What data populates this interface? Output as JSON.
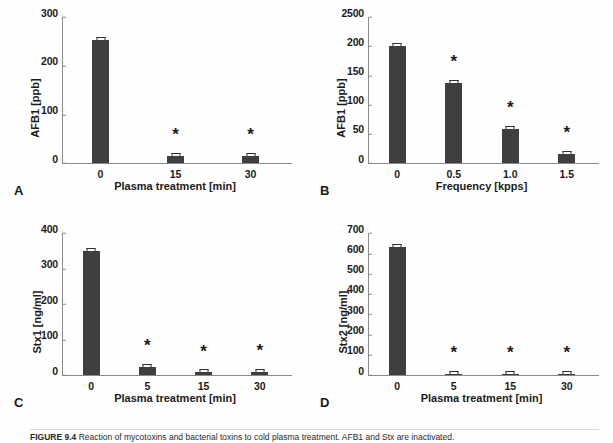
{
  "figure": {
    "caption_prefix": "FIGURE 9.4",
    "caption_text": "Reaction of mycotoxins and bacterial toxins to cold plasma treatment. AFB1 and Stx are inactivated."
  },
  "chart_data": [
    {
      "id": "A",
      "type": "bar",
      "panel_letter": "A",
      "title": "",
      "xlabel": "Plasma treatment [min]",
      "ylabel": "AFB1 [ppb]",
      "categories": [
        "0",
        "15",
        "30"
      ],
      "values": [
        255,
        15,
        14
      ],
      "errors": [
        3,
        2,
        2
      ],
      "significance": [
        "",
        "*",
        "*"
      ],
      "ylim": [
        0,
        300
      ],
      "yticks": [
        0,
        100,
        200,
        300
      ],
      "ytick_labels": [
        "0",
        "100",
        "200",
        "300"
      ],
      "grid": false,
      "legend": "none",
      "bar_color": "#3f3f3f"
    },
    {
      "id": "B",
      "type": "bar",
      "panel_letter": "B",
      "title": "",
      "xlabel": "Frequency [kpps]",
      "ylabel": "AFB1 [ppb]",
      "categories": [
        "0",
        "0.5",
        "1.0",
        "1.5"
      ],
      "values": [
        202,
        138,
        58,
        15
      ],
      "errors": [
        2,
        2,
        2,
        2
      ],
      "significance": [
        "",
        "*",
        "*",
        "*"
      ],
      "ylim": [
        0,
        250
      ],
      "yticks": [
        0,
        50,
        100,
        150,
        200,
        250
      ],
      "ytick_labels": [
        "0",
        "50",
        "100",
        "150",
        "200",
        "2500"
      ],
      "grid": false,
      "legend": "none",
      "bar_color": "#3f3f3f"
    },
    {
      "id": "C",
      "type": "bar",
      "panel_letter": "C",
      "title": "",
      "xlabel": "Plasma treatment [min]",
      "ylabel": "Stx1 [ng/ml]",
      "categories": [
        "0",
        "5",
        "15",
        "30"
      ],
      "values": [
        352,
        23,
        8,
        9
      ],
      "errors": [
        4,
        2,
        2,
        2
      ],
      "significance": [
        "",
        "*",
        "*",
        "*"
      ],
      "ylim": [
        0,
        400
      ],
      "yticks": [
        0,
        100,
        200,
        300,
        400
      ],
      "ytick_labels": [
        "0",
        "100",
        "200",
        "300",
        "400"
      ],
      "grid": false,
      "legend": "none",
      "bar_color": "#3f3f3f"
    },
    {
      "id": "D",
      "type": "bar",
      "panel_letter": "D",
      "title": "",
      "xlabel": "Plasma treatment [min]",
      "ylabel": "Stx2 [ng/ml]",
      "categories": [
        "0",
        "5",
        "15",
        "30"
      ],
      "values": [
        637,
        4,
        7,
        3
      ],
      "errors": [
        9,
        1,
        2,
        1
      ],
      "significance": [
        "",
        "*",
        "*",
        "*"
      ],
      "ylim": [
        0,
        700
      ],
      "yticks": [
        0,
        100,
        200,
        300,
        400,
        500,
        600,
        700
      ],
      "ytick_labels": [
        "0",
        "100",
        "200",
        "300",
        "400",
        "500",
        "600",
        "700"
      ],
      "grid": false,
      "legend": "none",
      "bar_color": "#3f3f3f"
    }
  ]
}
